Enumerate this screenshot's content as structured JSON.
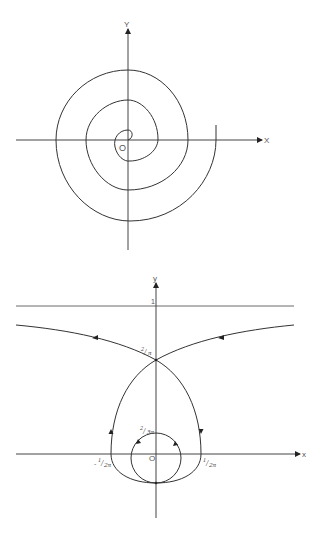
{
  "figure_top": {
    "title": "Spiral trajectory about the origin",
    "labels": {
      "y_axis": "Y",
      "x_axis": "X",
      "origin": "O"
    }
  },
  "figure_bottom": {
    "title": "Phase curves with separatrix",
    "labels": {
      "y_axis": "y",
      "x_axis": "x",
      "origin": "O",
      "asymptote": "1",
      "cusp": "2/π",
      "inner_top": "2/3π",
      "x_left": "-1/2π",
      "x_right": "1/2π"
    },
    "frac_parts": {
      "cusp_num": "2",
      "cusp_den": "π",
      "inner_num": "2",
      "inner_den": "3π",
      "left_sign": "-",
      "left_num": "1",
      "left_den": "2π",
      "right_num": "1",
      "right_den": "2π"
    }
  },
  "colors": {
    "line": "#333333",
    "axis": "#444444",
    "background": "#ffffff"
  }
}
